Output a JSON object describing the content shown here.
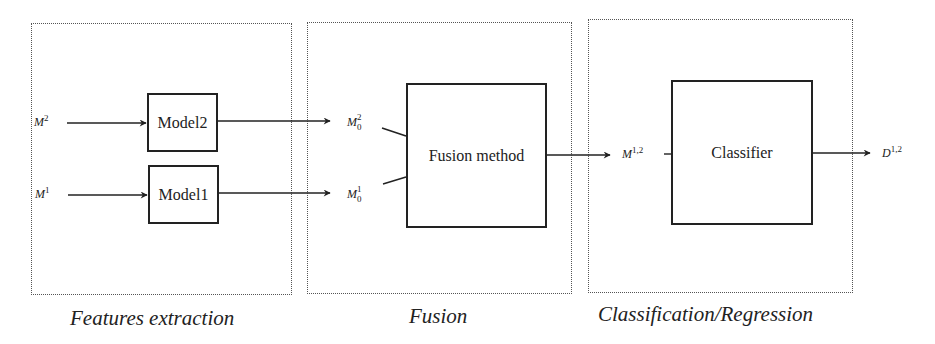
{
  "stages": [
    {
      "id": "features-extraction",
      "caption": "Features extraction"
    },
    {
      "id": "fusion",
      "caption": "Fusion"
    },
    {
      "id": "classification-regression",
      "caption": "Classification/Regression"
    }
  ],
  "inputs": {
    "m2": {
      "base": "M",
      "sup": "2"
    },
    "m1": {
      "base": "M",
      "sup": "1"
    }
  },
  "models": [
    {
      "label": "Model2"
    },
    {
      "label": "Model1"
    }
  ],
  "fusion_inputs": {
    "m02": {
      "base": "M",
      "sup": "2",
      "sub": "0"
    },
    "m01": {
      "base": "M",
      "sup": "1",
      "sub": "0"
    }
  },
  "fusion_block": {
    "label": "Fusion method"
  },
  "fused": {
    "base": "M",
    "sup": "1,2"
  },
  "classifier_block": {
    "label": "Classifier"
  },
  "output": {
    "base": "D",
    "sup": "1,2"
  },
  "colors": {
    "line": "#222222",
    "dotted_border": "#555555",
    "background": "#ffffff"
  }
}
